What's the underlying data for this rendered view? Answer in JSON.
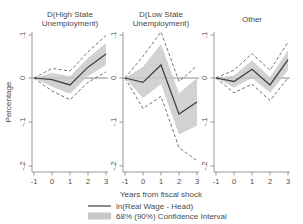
{
  "chart_data": {
    "type": "line",
    "title": "",
    "xlabel": "Years from fiscal shock",
    "ylabel": "Percentage",
    "x": [
      -1,
      0,
      1,
      2,
      3
    ],
    "xticks": [
      "-1",
      "0",
      "1",
      "2",
      "3"
    ],
    "xlim": [
      -1,
      3
    ],
    "yticks": [
      ".1",
      "0",
      "-.1",
      "-.2"
    ],
    "ytickvals": [
      0.1,
      0,
      -0.1,
      -0.2
    ],
    "ylim": [
      -0.22,
      0.12
    ],
    "grid": false,
    "legend_position": "bottom-center",
    "legend": [
      {
        "label": "ln(Real Wage - Head)",
        "marker": "line",
        "color": "#3f3f3f"
      },
      {
        "label": "68% (90%) Confidence Interval",
        "marker": "band",
        "color": "#c8c8c8"
      }
    ],
    "panels": [
      {
        "title_line1": "D(High State",
        "title_line2": "Unemployment)",
        "series": {
          "name": "ln(Real Wage - Head)",
          "values": [
            0,
            -0.004,
            -0.016,
            0.025,
            0.055
          ]
        },
        "ci68_upper": [
          0,
          0.012,
          0.004,
          0.046,
          0.08
        ],
        "ci68_lower": [
          0,
          -0.02,
          -0.036,
          0.004,
          0.03
        ],
        "ci90_upper": [
          0,
          0.022,
          0.016,
          0.06,
          0.098
        ],
        "ci90_lower": [
          0,
          -0.03,
          -0.05,
          -0.01,
          0.014
        ]
      },
      {
        "title_line1": "D(Low State",
        "title_line2": "Unemployment)",
        "series": {
          "name": "ln(Real Wage - Head)",
          "values": [
            0,
            -0.01,
            0.03,
            -0.083,
            -0.055
          ]
        },
        "ci68_upper": [
          0,
          0.026,
          0.078,
          -0.035,
          0.0
        ],
        "ci68_lower": [
          0,
          -0.046,
          -0.014,
          -0.13,
          -0.11
        ],
        "ci90_upper": [
          0,
          0.05,
          0.106,
          -0.008,
          0.028
        ],
        "ci90_lower": [
          0,
          -0.07,
          -0.042,
          -0.16,
          -0.19
        ]
      },
      {
        "title_line1": "Other",
        "title_line2": "",
        "series": {
          "name": "ln(Real Wage - Head)",
          "values": [
            0,
            -0.008,
            0.02,
            -0.016,
            0.042
          ]
        },
        "ci68_upper": [
          0,
          0.006,
          0.04,
          0.002,
          0.064
        ],
        "ci68_lower": [
          0,
          -0.022,
          0.0,
          -0.034,
          0.018
        ],
        "ci90_upper": [
          0,
          0.018,
          0.056,
          0.018,
          0.082
        ],
        "ci90_lower": [
          0,
          -0.034,
          -0.014,
          -0.052,
          0.0
        ]
      }
    ]
  },
  "labels": {
    "ylabel": "Percentage",
    "xlabel": "Years from fiscal shock",
    "panel1_title_l1": "D(High State",
    "panel1_title_l2": "Unemployment)",
    "panel2_title_l1": "D(Low State",
    "panel2_title_l2": "Unemployment)",
    "panel3_title_l1": "Other",
    "legend_line": "ln(Real Wage - Head)",
    "legend_band": "68% (90%) Confidence Interval",
    "ytick_1": ".1",
    "ytick_2": "0",
    "ytick_3": "-.1",
    "ytick_4": "-.2",
    "xtick_1": "-1",
    "xtick_2": "0",
    "xtick_3": "1",
    "xtick_4": "2",
    "xtick_5": "3"
  }
}
